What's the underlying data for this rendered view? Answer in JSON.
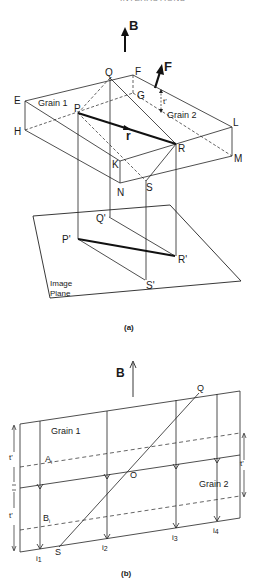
{
  "page_header": "INTERACTIONS",
  "figure_a": {
    "caption": "(a)",
    "field_label": "B",
    "force_label": "F",
    "vector_label": "r",
    "thickness_label": "t'",
    "grain1_label": "Grain 1",
    "grain2_label": "Grain 2",
    "image_plane_line1": "Image",
    "image_plane_line2": "Plane",
    "points": {
      "E": "E",
      "F": "F",
      "G": "G",
      "H": "H",
      "K": "K",
      "L": "L",
      "M": "M",
      "N": "N",
      "P": "P",
      "Q": "Q",
      "R": "R",
      "S": "S",
      "P_prime": "P'",
      "Q_prime": "Q'",
      "R_prime": "R'",
      "S_prime": "S'"
    }
  },
  "figure_b": {
    "caption": "(b)",
    "field_label": "B",
    "grain1_label": "Grain 1",
    "grain2_label": "Grain 2",
    "thickness_left_upper": "t'",
    "thickness_left_lower": "t'",
    "thickness_right": "t'",
    "boundary_marker": "x",
    "points": {
      "Q": "Q",
      "O": "O",
      "S": "S",
      "A": "A",
      "A_sub": "i",
      "B": "B",
      "B_sub": "i"
    },
    "intensities": [
      {
        "base": "i",
        "sub": "1"
      },
      {
        "base": "i",
        "sub": "2"
      },
      {
        "base": "i",
        "sub": "3"
      },
      {
        "base": "i",
        "sub": "4"
      }
    ]
  }
}
